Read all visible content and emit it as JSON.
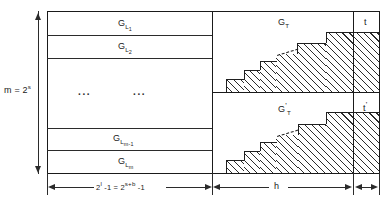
{
  "figure": {
    "type": "diagram"
  },
  "left_column": {
    "rows": [
      {
        "label_base": "G",
        "label_sub": "L",
        "label_sub_sub": "1",
        "name": "row-gl1"
      },
      {
        "label_base": "G",
        "label_sub": "L",
        "label_sub_sub": "2",
        "name": "row-gl2"
      },
      {
        "label_base": "",
        "label_sub": "",
        "label_sub_sub": "",
        "name": "row-ellipsis"
      },
      {
        "label_base": "G",
        "label_sub": "L",
        "label_sub_sub": "m-1",
        "name": "row-glm1"
      },
      {
        "label_base": "G",
        "label_sub": "L",
        "label_sub_sub": "m",
        "name": "row-glm"
      }
    ],
    "ellipsis_left": "...",
    "ellipsis_right": "..."
  },
  "vertical_dimension": {
    "text_base": "m = 2",
    "text_exp": "s"
  },
  "right_blocks": {
    "top": {
      "label_base": "G",
      "label_sub": "T",
      "prime": ""
    },
    "bottom": {
      "label_base": "G",
      "label_sub": "T",
      "prime": "'"
    }
  },
  "tail_columns": {
    "top": {
      "label": "t"
    },
    "bottom": {
      "label": "t",
      "prime": "'"
    }
  },
  "bottom_dimensions": {
    "left": {
      "base1": "2",
      "exp1": "l",
      "mid": " -1 = 2",
      "exp2": "s+b",
      "tail": " -1"
    },
    "center": {
      "label": "h"
    },
    "right": {
      "label": ""
    }
  },
  "colors": {
    "ink": "#1f1f1f",
    "line": "#2b2b2b",
    "paper": "#ffffff"
  }
}
